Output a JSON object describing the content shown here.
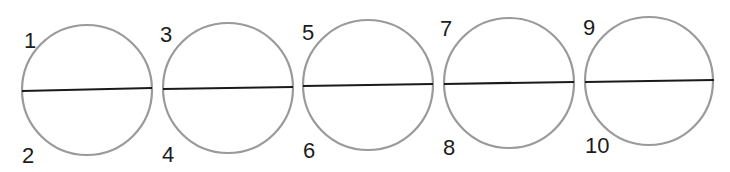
{
  "diagram": {
    "colors": {
      "circle_stroke": "#9a9a9a",
      "line_stroke": "#1a1a1a",
      "label_color": "#1c1c1c",
      "background": "#ffffff"
    },
    "circles": [
      {
        "id": "circle-1",
        "cx": 87,
        "cy": 90,
        "r": 65,
        "line": {
          "x1": 22,
          "y1": 91,
          "x2": 152,
          "y2": 88
        },
        "top_label": {
          "text": "1",
          "x": 24,
          "y": 48
        },
        "bottom_label": {
          "text": "2",
          "x": 22,
          "y": 163
        }
      },
      {
        "id": "circle-2",
        "cx": 228,
        "cy": 88,
        "r": 65,
        "line": {
          "x1": 163,
          "y1": 89,
          "x2": 293,
          "y2": 87
        },
        "top_label": {
          "text": "3",
          "x": 160,
          "y": 42
        },
        "bottom_label": {
          "text": "4",
          "x": 162,
          "y": 162
        }
      },
      {
        "id": "circle-3",
        "cx": 368,
        "cy": 85,
        "r": 65,
        "line": {
          "x1": 303,
          "y1": 86,
          "x2": 433,
          "y2": 84
        },
        "top_label": {
          "text": "5",
          "x": 302,
          "y": 40
        },
        "bottom_label": {
          "text": "6",
          "x": 303,
          "y": 158
        }
      },
      {
        "id": "circle-4",
        "cx": 509,
        "cy": 83,
        "r": 65,
        "line": {
          "x1": 444,
          "y1": 84,
          "x2": 574,
          "y2": 82
        },
        "top_label": {
          "text": "7",
          "x": 440,
          "y": 36
        },
        "bottom_label": {
          "text": "8",
          "x": 443,
          "y": 155
        }
      },
      {
        "id": "circle-5",
        "cx": 649,
        "cy": 81,
        "r": 64,
        "line": {
          "x1": 585,
          "y1": 82,
          "x2": 714,
          "y2": 80
        },
        "top_label": {
          "text": "9",
          "x": 583,
          "y": 35
        },
        "bottom_label": {
          "text": "10",
          "x": 585,
          "y": 153
        }
      }
    ]
  }
}
